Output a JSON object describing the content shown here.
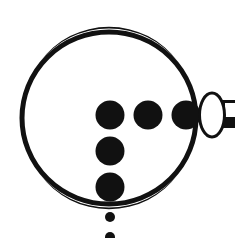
{
  "figure": {
    "colors": {
      "ink": "#111111",
      "background": "#ffffff"
    },
    "ring": {
      "cx": 109,
      "cy": 118,
      "rx": 87,
      "ry": 86,
      "stroke_width": 5
    },
    "dots_horizontal": [
      {
        "cx": 110,
        "cy": 115,
        "r": 14.5
      },
      {
        "cx": 148,
        "cy": 115,
        "r": 14.5
      },
      {
        "cx": 186,
        "cy": 115,
        "r": 14.5
      }
    ],
    "dots_vertical": [
      {
        "cx": 110,
        "cy": 151,
        "r": 14.5
      },
      {
        "cx": 110,
        "cy": 187,
        "r": 14.5
      }
    ],
    "dots_small": [
      {
        "cx": 110,
        "cy": 217,
        "r": 5
      },
      {
        "cx": 110,
        "cy": 237,
        "r": 5
      }
    ],
    "oval": {
      "cx": 212,
      "cy": 115,
      "rx": 12.5,
      "ry": 22,
      "stroke_width": 3
    },
    "handle": {
      "top_bar_y": 100,
      "top_bar_h": 3,
      "bottom_bar_y": 117,
      "bottom_bar_h": 11,
      "x_start": 222,
      "x_end": 235
    }
  }
}
